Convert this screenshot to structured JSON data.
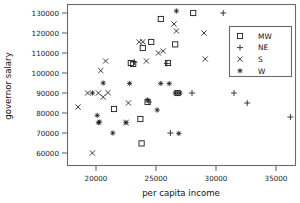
{
  "chart_data": {
    "type": "scatter",
    "title": "",
    "xlabel": "per capita income",
    "ylabel": "governor salary",
    "xlim": [
      17500,
      37000
    ],
    "ylim": [
      57000,
      133000
    ],
    "xticks": [
      20000,
      25000,
      30000,
      35000
    ],
    "yticks": [
      60000,
      70000,
      80000,
      90000,
      100000,
      110000,
      120000,
      130000
    ],
    "xtick_labels": [
      "20000",
      "25000",
      "30000",
      "35000"
    ],
    "ytick_labels": [
      "60000",
      "70000",
      "80000",
      "90000",
      "100000",
      "110000",
      "120000",
      "130000"
    ],
    "grid": false,
    "legend_position": "upper right",
    "legend_entries": [
      {
        "name": "MW",
        "marker": "square-open-marker"
      },
      {
        "name": "NE",
        "marker": "plus-marker"
      },
      {
        "name": "S",
        "marker": "x-marker"
      },
      {
        "name": "W",
        "marker": "asterisk-marker"
      }
    ],
    "series": [
      {
        "name": "MW",
        "marker": "square-open-marker",
        "points": [
          [
            21500,
            82000
          ],
          [
            22900,
            105000
          ],
          [
            23100,
            104500
          ],
          [
            23700,
            77000
          ],
          [
            23800,
            64800
          ],
          [
            23900,
            112500
          ],
          [
            24300,
            85500
          ],
          [
            24600,
            115500
          ],
          [
            25400,
            127000
          ],
          [
            26000,
            105000
          ],
          [
            26600,
            114300
          ],
          [
            26800,
            90000
          ],
          [
            28100,
            130000
          ]
        ]
      },
      {
        "name": "NE",
        "marker": "plus-marker",
        "points": [
          [
            23200,
            105500
          ],
          [
            24400,
            85500
          ],
          [
            25900,
            104800
          ],
          [
            26200,
            70000
          ],
          [
            26800,
            90000
          ],
          [
            28000,
            90000
          ],
          [
            30600,
            130000
          ],
          [
            31500,
            90000
          ],
          [
            32600,
            85000
          ],
          [
            36200,
            78000
          ]
        ]
      },
      {
        "name": "S",
        "marker": "x-marker",
        "points": [
          [
            18500,
            83000
          ],
          [
            19300,
            90000
          ],
          [
            19700,
            60000
          ],
          [
            20200,
            90000
          ],
          [
            20400,
            101200
          ],
          [
            20600,
            88000
          ],
          [
            20800,
            106000
          ],
          [
            21000,
            90200
          ],
          [
            22500,
            75200
          ],
          [
            22700,
            85000
          ],
          [
            23600,
            115500
          ],
          [
            23900,
            115600
          ],
          [
            24200,
            106000
          ],
          [
            25200,
            110000
          ],
          [
            25600,
            111000
          ],
          [
            26500,
            124500
          ],
          [
            26700,
            121000
          ],
          [
            29000,
            120000
          ],
          [
            29100,
            107000
          ]
        ]
      },
      {
        "name": "W",
        "marker": "asterisk-marker",
        "points": [
          [
            19700,
            90000
          ],
          [
            20100,
            78800
          ],
          [
            20200,
            75200
          ],
          [
            20300,
            75500
          ],
          [
            20600,
            95000
          ],
          [
            21400,
            70000
          ],
          [
            22500,
            75200
          ],
          [
            22800,
            94800
          ],
          [
            24300,
            86500
          ],
          [
            25100,
            81500
          ],
          [
            25400,
            94800
          ],
          [
            26100,
            94700
          ],
          [
            26600,
            90000
          ],
          [
            26700,
            131000
          ],
          [
            26900,
            69800
          ],
          [
            27000,
            90000
          ]
        ]
      }
    ]
  },
  "axes": {
    "x_title": "per capita income",
    "y_title": "governor salary"
  }
}
